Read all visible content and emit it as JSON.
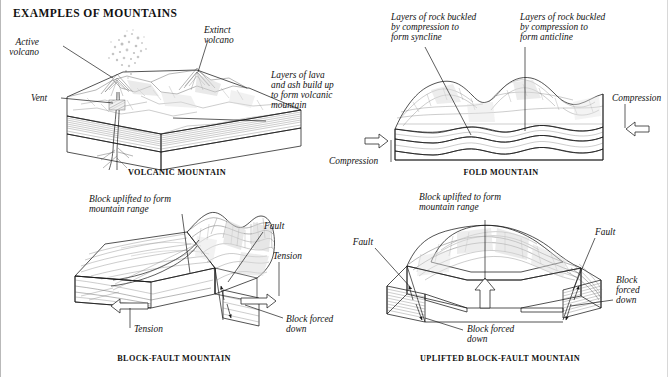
{
  "page": {
    "title": "EXAMPLES OF MOUNTAINS",
    "background_color": "#ffffff",
    "ink_color": "#111111"
  },
  "figures": [
    {
      "id": "volcanic-mountain",
      "caption": "VOLCANIC MOUNTAIN",
      "labels": [
        {
          "name": "active-volcano",
          "text": "Active\nvolcano",
          "line1": "Active",
          "line2": "volcano"
        },
        {
          "name": "extinct-volcano",
          "text": "Extinct\nvolcano",
          "line1": "Extinct",
          "line2": "volcano"
        },
        {
          "name": "vent",
          "text": "Vent",
          "line1": "Vent",
          "line2": ""
        },
        {
          "name": "layers-of-lava",
          "text": "Layers of lava and ash build up to form volcanic mountain",
          "line1": "Layers of lava",
          "line2": "and ash build up",
          "line3": "to form volcanic",
          "line4": "mountain"
        }
      ]
    },
    {
      "id": "fold-mountain",
      "caption": "FOLD MOUNTAIN",
      "labels": [
        {
          "name": "syncline",
          "line1": "Layers of rock buckled",
          "line2": "by compression to",
          "line3": "form syncline"
        },
        {
          "name": "anticline",
          "line1": "Layers of rock buckled",
          "line2": "by compression to",
          "line3": "form anticline"
        },
        {
          "name": "compression-left",
          "line1": "Compression",
          "line2": ""
        },
        {
          "name": "compression-right",
          "line1": "Compression",
          "line2": ""
        }
      ]
    },
    {
      "id": "block-fault-mountain",
      "caption": "BLOCK-FAULT MOUNTAIN",
      "labels": [
        {
          "name": "block-uplifted",
          "line1": "Block uplifted to form",
          "line2": "mountain range"
        },
        {
          "name": "fault-right",
          "line1": "Fault",
          "line2": ""
        },
        {
          "name": "tension-right",
          "line1": "Tension",
          "line2": ""
        },
        {
          "name": "tension-bottom",
          "line1": "Tension",
          "line2": ""
        },
        {
          "name": "block-forced-down",
          "line1": "Block forced",
          "line2": "down"
        }
      ]
    },
    {
      "id": "uplifted-block-fault-mountain",
      "caption": "UPLIFTED BLOCK-FAULT MOUNTAIN",
      "labels": [
        {
          "name": "block-uplifted",
          "line1": "Block uplifted to form",
          "line2": "mountain range"
        },
        {
          "name": "fault-left",
          "line1": "Fault",
          "line2": ""
        },
        {
          "name": "fault-right",
          "line1": "Fault",
          "line2": ""
        },
        {
          "name": "block-forced-down-left",
          "line1": "Block forced",
          "line2": "down"
        },
        {
          "name": "block-forced-down-right",
          "line1": "Block",
          "line2": "forced",
          "line3": "down"
        }
      ]
    }
  ],
  "icons": {
    "arrow_right": "arrow-right-outline-icon",
    "arrow_left": "arrow-left-outline-icon",
    "arrow_up": "arrow-up-outline-icon",
    "fault_arrow": "fault-slip-arrow-icon"
  }
}
